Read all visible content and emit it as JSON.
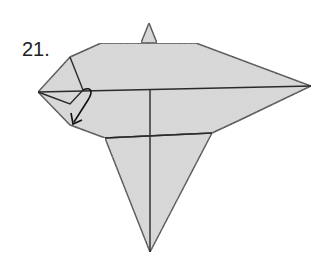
{
  "step": {
    "number": "21."
  },
  "diagram": {
    "fill_color": "#d6d6d6",
    "line_color": "#2a2a2a",
    "arrow": {
      "type": "fold-arrow",
      "direction": "down-left"
    }
  }
}
